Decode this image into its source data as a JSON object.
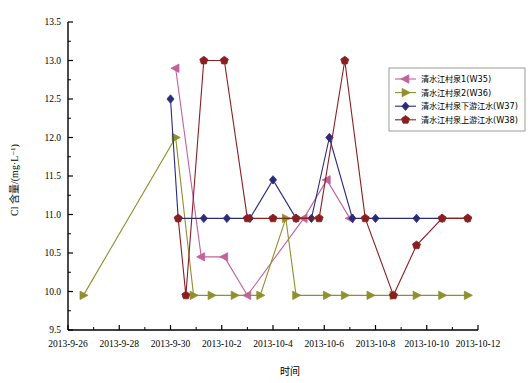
{
  "chart_data": {
    "type": "line",
    "title": "",
    "xlabel": "时间",
    "ylabel": "Cl 含量/(mg·L⁻¹)",
    "ylim": [
      9.5,
      13.5
    ],
    "ytick_step": 0.5,
    "yticks": [
      "9.5",
      "10.0",
      "10.5",
      "11.0",
      "11.5",
      "12.0",
      "12.5",
      "13.0",
      "13.5"
    ],
    "ytick_values": [
      9.5,
      10.0,
      10.5,
      11.0,
      11.5,
      12.0,
      12.5,
      13.0,
      13.5
    ],
    "xticks": [
      "2013-9-26",
      "2013-9-28",
      "2013-9-30",
      "2013-10-2",
      "2013-10-4",
      "2013-10-6",
      "2013-10-8",
      "2013-10-10",
      "2013-10-12"
    ],
    "xtick_values": [
      0,
      2,
      4,
      6,
      8,
      10,
      12,
      14,
      16
    ],
    "xlim": [
      0,
      16
    ],
    "minor_ticks": true,
    "grid": false,
    "legend_position": "right-top",
    "series": [
      {
        "name": "清水江村泉1(W35)",
        "key": "W35",
        "color": "#C2629B",
        "marker": "triangle-left",
        "x": [
          4.2,
          5.2,
          6.1,
          7.0,
          9.2,
          10.1,
          11.0
        ],
        "values": [
          12.9,
          10.45,
          10.45,
          9.95,
          10.95,
          11.45,
          10.95
        ]
      },
      {
        "name": "清水江村泉2(W36)",
        "key": "W36",
        "color": "#8F8F2E",
        "marker": "triangle-right",
        "x": [
          0.6,
          4.2,
          4.9,
          5.6,
          6.5,
          7.5,
          8.5,
          8.9,
          10.1,
          10.8,
          11.8,
          12.7,
          13.6,
          14.6,
          15.6
        ],
        "values": [
          9.95,
          12.0,
          9.95,
          9.95,
          9.95,
          9.95,
          10.95,
          9.95,
          9.95,
          9.95,
          9.95,
          9.95,
          9.95,
          9.95,
          9.95
        ]
      },
      {
        "name": "清水江村泉下游江水(W37)",
        "key": "W37",
        "color": "#2B2B7C",
        "marker": "diamond",
        "x": [
          4.0,
          4.3,
          5.3,
          6.2,
          7.1,
          8.0,
          8.9,
          9.5,
          10.2,
          11.1,
          12.0,
          13.6,
          14.6,
          15.6
        ],
        "values": [
          12.5,
          10.95,
          10.95,
          10.95,
          10.95,
          11.45,
          10.95,
          10.95,
          12.0,
          10.95,
          10.95,
          10.95,
          10.95,
          10.95
        ]
      },
      {
        "name": "清水江村泉上游江水(W38)",
        "key": "W38",
        "color": "#8A1F22",
        "marker": "pentagon",
        "x": [
          4.3,
          4.6,
          5.3,
          6.1,
          7.0,
          8.0,
          8.9,
          9.8,
          10.8,
          11.6,
          12.7,
          13.6,
          14.6,
          15.6
        ],
        "values": [
          10.95,
          9.95,
          13.0,
          13.0,
          10.95,
          10.95,
          10.95,
          10.95,
          13.0,
          10.95,
          9.95,
          10.6,
          10.95,
          10.95
        ]
      }
    ]
  },
  "axes": {
    "y_axis_label": "Cl 含量/(mg·L⁻¹)",
    "x_axis_label": "时间"
  },
  "legend": {
    "items": [
      {
        "label": "清水江村泉1(W35)",
        "color": "#C2629B",
        "marker": "triangle-left"
      },
      {
        "label": "清水江村泉2(W36)",
        "color": "#8F8F2E",
        "marker": "triangle-right"
      },
      {
        "label": "清水江村泉下游江水(W37)",
        "color": "#2B2B7C",
        "marker": "diamond"
      },
      {
        "label": "清水江村泉上游江水(W38)",
        "color": "#8A1F22",
        "marker": "pentagon"
      }
    ]
  }
}
